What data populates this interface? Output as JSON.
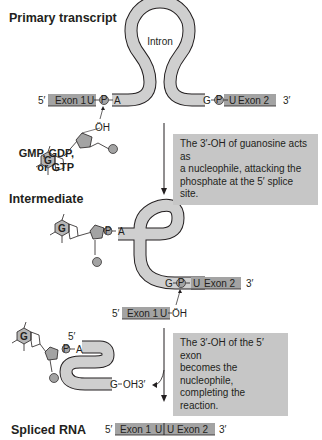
{
  "title_stages": {
    "primary": "Primary transcript",
    "intermediate": "Intermediate",
    "spliced": "Spliced RNA"
  },
  "labels": {
    "intron": "Intron",
    "exon1": "Exon 1",
    "exon2": "Exon 2",
    "five_prime": "5′",
    "three_prime": "3′",
    "u": "U",
    "a": "A",
    "g": "G",
    "p": "P",
    "oh": "ÖH",
    "oh3": "OH 3′",
    "guanosine_source": [
      "GMP, GDP,",
      "or GTP"
    ]
  },
  "notes": {
    "step1": [
      "The 3′-OH of guanosine acts as",
      "a nucleophile, attacking the",
      "phosphate at the 5′ splice site."
    ],
    "step2": [
      "The 3′-OH of the 5′ exon",
      "becomes the nucleophile,",
      "completing the reaction."
    ]
  },
  "colors": {
    "exon": "#a3a3a3",
    "intron": "#cfcfcf",
    "note_bg": "#c6c6c6",
    "stroke": "#231f20"
  }
}
